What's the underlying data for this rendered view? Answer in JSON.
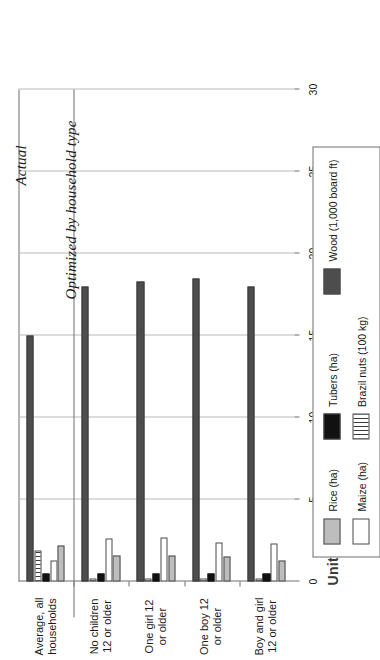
{
  "chart_data": {
    "type": "bar",
    "orientation": "horizontal-grouped",
    "title": "",
    "xlabel": "Units of production",
    "ylabel": "",
    "xlim": [
      0,
      30
    ],
    "xticks": [
      "0",
      "5",
      "10",
      "15",
      "20",
      "25",
      "30"
    ],
    "grid": true,
    "legend_position": "right",
    "section_titles": [
      "Actual",
      "Optimized by household type"
    ],
    "categories": [
      "Average, all households",
      "No children 12 or older",
      "One girl 12 or older",
      "One boy 12 or older",
      "Boy and girl 12 or older"
    ],
    "category_lines": [
      [
        "Average, all",
        "households"
      ],
      [
        "No children",
        "12 or older"
      ],
      [
        "One girl 12",
        "or older"
      ],
      [
        "One boy 12",
        "or older"
      ],
      [
        "Boy and girl",
        "12 or older"
      ]
    ],
    "series": [
      {
        "name": "Rice (ha)",
        "color": "#bdbdbd",
        "values": [
          2.2,
          1.6,
          1.6,
          1.5,
          1.3
        ]
      },
      {
        "name": "Maize (ha)",
        "color": "#ffffff",
        "values": [
          1.3,
          2.6,
          2.7,
          2.4,
          2.3
        ]
      },
      {
        "name": "Tubers (ha)",
        "color": "#111111",
        "values": [
          0.5,
          0.5,
          0.5,
          0.5,
          0.5
        ]
      },
      {
        "name": "Brazil nuts (100 kg)",
        "color": "#ffffff",
        "values": [
          1.9,
          0.2,
          0.2,
          0.2,
          0.2
        ]
      },
      {
        "name": "Wood (1,000 board ft)",
        "color": "#4d4d4d",
        "values": [
          15.0,
          18.0,
          18.3,
          18.5,
          18.0
        ]
      }
    ]
  },
  "legend": {
    "items": [
      {
        "label": "Rice (ha)",
        "swatch": "swatch-rice"
      },
      {
        "label": "Tubers (ha)",
        "swatch": "swatch-tubers"
      },
      {
        "label": "Wood (1,000 board ft)",
        "swatch": "swatch-wood"
      },
      {
        "label": "Maize (ha)",
        "swatch": "swatch-maize"
      },
      {
        "label": "Brazil nuts (100 kg)",
        "swatch": "swatch-brazil"
      }
    ]
  }
}
